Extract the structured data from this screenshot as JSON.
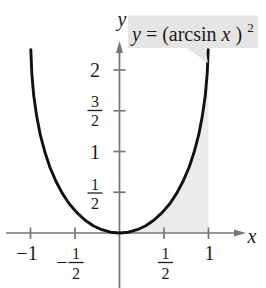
{
  "figure": {
    "background": "#ffffff",
    "axis_color": "#767676",
    "curve_color": "#111111",
    "shade_color": "#ebebeb",
    "label_box_color": "#e5e5e5",
    "text_color": "#1c1c1c"
  },
  "title": {
    "lhs": "y",
    "eq": " = (arcsin ",
    "var": "x",
    "close": ")",
    "sup": "2"
  },
  "axis_labels": {
    "x": "x",
    "y": "y"
  },
  "chart_data": {
    "type": "line",
    "xlabel": "x",
    "ylabel": "y",
    "xlim": [
      -1.27,
      1.65
    ],
    "ylim": [
      -0.67,
      2.83
    ],
    "grid": false,
    "legend": "none",
    "x_ticks": [
      {
        "value": -1,
        "label": "−1"
      },
      {
        "value": -0.5,
        "sign": "−",
        "num": "1",
        "den": "2"
      },
      {
        "value": 0.5,
        "num": "1",
        "den": "2"
      },
      {
        "value": 1,
        "label": "1"
      }
    ],
    "y_ticks": [
      {
        "value": 0.5,
        "num": "1",
        "den": "2"
      },
      {
        "value": 1,
        "label": "1"
      },
      {
        "value": 1.5,
        "num": "3",
        "den": "2"
      },
      {
        "value": 2,
        "label": "2"
      }
    ],
    "shaded_region": "region bounded by the curve, the vertical line x = 1, and the x-axis",
    "points": [
      [
        -0.997,
        2.25
      ],
      [
        -0.985,
        1.96
      ],
      [
        -0.964,
        1.69
      ],
      [
        -0.932,
        1.44
      ],
      [
        -0.891,
        1.21
      ],
      [
        -0.841,
        1.0
      ],
      [
        -0.783,
        0.81
      ],
      [
        -0.717,
        0.64
      ],
      [
        -0.644,
        0.49
      ],
      [
        -0.565,
        0.36
      ],
      [
        -0.479,
        0.25
      ],
      [
        -0.389,
        0.16
      ],
      [
        -0.296,
        0.09
      ],
      [
        -0.199,
        0.04
      ],
      [
        -0.1,
        0.01
      ],
      [
        0,
        0
      ],
      [
        0.1,
        0.01
      ],
      [
        0.199,
        0.04
      ],
      [
        0.296,
        0.09
      ],
      [
        0.389,
        0.16
      ],
      [
        0.479,
        0.25
      ],
      [
        0.565,
        0.36
      ],
      [
        0.644,
        0.49
      ],
      [
        0.717,
        0.64
      ],
      [
        0.783,
        0.81
      ],
      [
        0.841,
        1.0
      ],
      [
        0.891,
        1.21
      ],
      [
        0.932,
        1.44
      ],
      [
        0.964,
        1.69
      ],
      [
        0.985,
        1.96
      ],
      [
        0.997,
        2.25
      ]
    ]
  }
}
